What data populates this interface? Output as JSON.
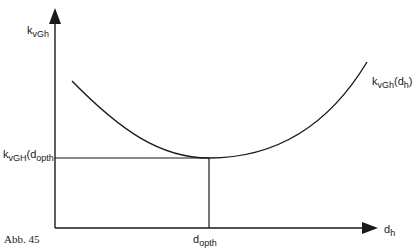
{
  "diagram": {
    "y_axis": {
      "base": "k",
      "sub": "vGh"
    },
    "x_axis": {
      "base": "d",
      "sub": "h"
    },
    "curve_label": {
      "base": "k",
      "sub": "vGh",
      "paren_base": "d",
      "paren_sub": "h"
    },
    "min_y_label": {
      "base": "k",
      "sub": "vGH",
      "paren_base": "d",
      "paren_sub": "opth"
    },
    "min_x_label": {
      "base": "d",
      "sub": "opth"
    },
    "caption": "Abb. 45",
    "line_color": "#1a1a1a"
  }
}
